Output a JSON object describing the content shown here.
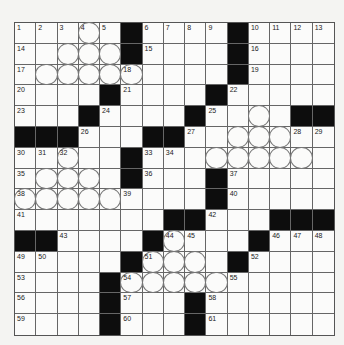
{
  "puzzle": {
    "size": 15,
    "colors": {
      "black": "#0d0d0d",
      "white": "#fbfbfa",
      "line": "#666666"
    },
    "rows": [
      ".....#....#....",
      ".....#....#....",
      "..........#....",
      "....#....#.....",
      "...#....#....##",
      "###...##.......",
      ".....#.........",
      ".....#...#.....",
      ".........#.....",
      ".......##...###",
      "##....#....#...",
      ".....#....#....",
      "....#..........",
      "....#...#......",
      "....#...#......"
    ],
    "circles": [
      [
        0,
        3
      ],
      [
        1,
        2
      ],
      [
        1,
        3
      ],
      [
        1,
        4
      ],
      [
        2,
        1
      ],
      [
        2,
        2
      ],
      [
        2,
        3
      ],
      [
        2,
        4
      ],
      [
        2,
        5
      ],
      [
        4,
        11
      ],
      [
        5,
        10
      ],
      [
        5,
        11
      ],
      [
        5,
        12
      ],
      [
        6,
        2
      ],
      [
        6,
        9
      ],
      [
        6,
        10
      ],
      [
        6,
        11
      ],
      [
        6,
        12
      ],
      [
        6,
        13
      ],
      [
        7,
        1
      ],
      [
        7,
        2
      ],
      [
        7,
        3
      ],
      [
        8,
        0
      ],
      [
        8,
        1
      ],
      [
        8,
        2
      ],
      [
        8,
        3
      ],
      [
        8,
        4
      ],
      [
        10,
        7
      ],
      [
        11,
        6
      ],
      [
        11,
        7
      ],
      [
        11,
        8
      ],
      [
        12,
        5
      ],
      [
        12,
        6
      ],
      [
        12,
        7
      ],
      [
        12,
        8
      ],
      [
        12,
        9
      ]
    ],
    "numbers": [
      [
        0,
        0,
        "1"
      ],
      [
        0,
        1,
        "2"
      ],
      [
        0,
        2,
        "3"
      ],
      [
        0,
        3,
        "4"
      ],
      [
        0,
        4,
        "5"
      ],
      [
        0,
        6,
        "6"
      ],
      [
        0,
        7,
        "7"
      ],
      [
        0,
        8,
        "8"
      ],
      [
        0,
        9,
        "9"
      ],
      [
        0,
        11,
        "10"
      ],
      [
        0,
        12,
        "11"
      ],
      [
        0,
        13,
        "12"
      ],
      [
        0,
        14,
        "13"
      ],
      [
        1,
        0,
        "14"
      ],
      [
        1,
        6,
        "15"
      ],
      [
        1,
        11,
        "16"
      ],
      [
        2,
        0,
        "17"
      ],
      [
        2,
        5,
        "18"
      ],
      [
        2,
        11,
        "19"
      ],
      [
        3,
        0,
        "20"
      ],
      [
        3,
        5,
        "21"
      ],
      [
        3,
        10,
        "22"
      ],
      [
        4,
        0,
        "23"
      ],
      [
        4,
        4,
        "24"
      ],
      [
        4,
        9,
        "25"
      ],
      [
        5,
        3,
        "26"
      ],
      [
        5,
        8,
        "27"
      ],
      [
        5,
        13,
        "28"
      ],
      [
        5,
        14,
        "29"
      ],
      [
        6,
        0,
        "30"
      ],
      [
        6,
        1,
        "31"
      ],
      [
        6,
        2,
        "32"
      ],
      [
        6,
        6,
        "33"
      ],
      [
        6,
        7,
        "34"
      ],
      [
        7,
        0,
        "35"
      ],
      [
        7,
        6,
        "36"
      ],
      [
        7,
        10,
        "37"
      ],
      [
        8,
        0,
        "38"
      ],
      [
        8,
        5,
        "39"
      ],
      [
        8,
        10,
        "40"
      ],
      [
        9,
        0,
        "41"
      ],
      [
        9,
        9,
        "42"
      ],
      [
        10,
        2,
        "43"
      ],
      [
        10,
        7,
        "44"
      ],
      [
        10,
        8,
        "45"
      ],
      [
        10,
        12,
        "46"
      ],
      [
        10,
        13,
        "47"
      ],
      [
        10,
        14,
        "48"
      ],
      [
        11,
        0,
        "49"
      ],
      [
        11,
        1,
        "50"
      ],
      [
        11,
        6,
        "51"
      ],
      [
        11,
        11,
        "52"
      ],
      [
        12,
        0,
        "53"
      ],
      [
        12,
        5,
        "54"
      ],
      [
        12,
        10,
        "55"
      ],
      [
        13,
        0,
        "56"
      ],
      [
        13,
        5,
        "57"
      ],
      [
        13,
        9,
        "58"
      ],
      [
        14,
        0,
        "59"
      ],
      [
        14,
        5,
        "60"
      ],
      [
        14,
        9,
        "61"
      ]
    ]
  }
}
